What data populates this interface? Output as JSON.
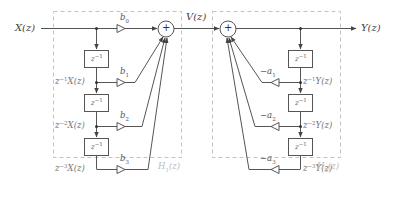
{
  "diagram": {
    "type": "direct-form-I IIR filter block diagram",
    "input_label": "X(z)",
    "intermediate_label": "V(z)",
    "output_label": "Y(z)",
    "subsystems": [
      {
        "name": "H1(z)",
        "label": "H",
        "subscript": "1",
        "arg": "(z)",
        "kind": "feedforward (FIR)"
      },
      {
        "name": "H2(z)",
        "label": "H",
        "subscript": "2",
        "arg": "(z)",
        "kind": "feedback (all-pole)"
      }
    ],
    "delay_label": "z",
    "delay_exp": "−1",
    "feedforward": {
      "gains": [
        "b0",
        "b1",
        "b2",
        "b3"
      ],
      "gain_labels": [
        {
          "base": "b",
          "sub": "0"
        },
        {
          "base": "b",
          "sub": "1"
        },
        {
          "base": "b",
          "sub": "2"
        },
        {
          "base": "b",
          "sub": "3"
        }
      ],
      "taps": [
        {
          "pre": "z",
          "exp": "−1",
          "post": "X(z)"
        },
        {
          "pre": "z",
          "exp": "−2",
          "post": "X(z)"
        },
        {
          "pre": "z",
          "exp": "−3",
          "post": "X(z)"
        }
      ]
    },
    "feedback": {
      "gains": [
        "−a1",
        "−a2",
        "−a3"
      ],
      "gain_labels": [
        {
          "base": "−a",
          "sub": "1"
        },
        {
          "base": "−a",
          "sub": "2"
        },
        {
          "base": "−a",
          "sub": "3"
        }
      ],
      "taps": [
        {
          "pre": "z",
          "exp": "−1",
          "post": "Y(z)"
        },
        {
          "pre": "z",
          "exp": "−2",
          "post": "Y(z)"
        },
        {
          "pre": "z",
          "exp": "−3",
          "post": "Y(z)"
        }
      ]
    },
    "sum_symbol": "+",
    "colors": {
      "line": "#555555",
      "dash": "#bbbbbb",
      "text": "#444444"
    }
  }
}
